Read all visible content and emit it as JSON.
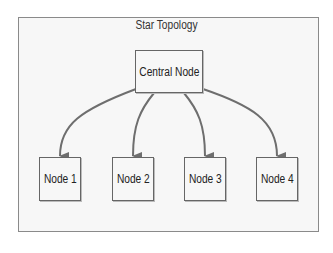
{
  "diagram": {
    "title": "Star Topology",
    "type": "star",
    "center": {
      "id": "central",
      "label": "Central Node"
    },
    "nodes": [
      {
        "id": "n1",
        "label": "Node 1"
      },
      {
        "id": "n2",
        "label": "Node 2"
      },
      {
        "id": "n3",
        "label": "Node 3"
      },
      {
        "id": "n4",
        "label": "Node 4"
      }
    ],
    "edges": [
      {
        "from": "central",
        "to": "n1",
        "directed": true
      },
      {
        "from": "central",
        "to": "n2",
        "directed": true
      },
      {
        "from": "central",
        "to": "n3",
        "directed": true
      },
      {
        "from": "central",
        "to": "n4",
        "directed": true
      }
    ],
    "colors": {
      "edge": "#6e6e6e",
      "border": "#666666",
      "background": "#f7f7f7"
    }
  }
}
